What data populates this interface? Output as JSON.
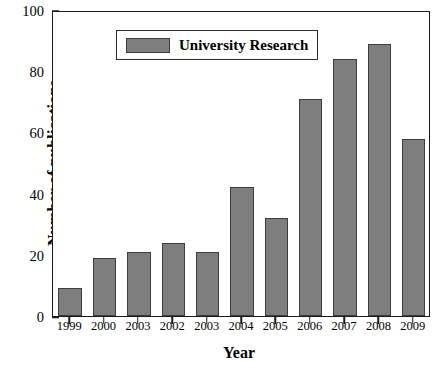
{
  "chart_data": {
    "type": "bar",
    "title": "",
    "xlabel": "Year",
    "ylabel": "Number of publications",
    "categories": [
      "1999",
      "2000",
      "2003",
      "2002",
      "2003",
      "2004",
      "2005",
      "2006",
      "2007",
      "2008",
      "2009"
    ],
    "values": [
      9,
      19,
      21,
      24,
      21,
      42,
      32,
      71,
      84,
      89,
      58
    ],
    "series": [
      {
        "name": "University Research",
        "values": [
          9,
          19,
          21,
          24,
          21,
          42,
          32,
          71,
          84,
          89,
          58
        ],
        "color": "#7e7e7e"
      }
    ],
    "ylim": [
      0,
      100
    ],
    "ytick_labels": [
      "0",
      "20",
      "40",
      "60",
      "80",
      "100"
    ],
    "ytick_values": [
      0,
      20,
      40,
      60,
      80,
      100
    ],
    "yminor_values": [
      10,
      30,
      50,
      70,
      90
    ],
    "grid": false,
    "legend": {
      "position": "top-left",
      "entries": [
        "University Research"
      ]
    }
  },
  "legend": {
    "label": "University Research"
  },
  "axes": {
    "x_title": "Year",
    "y_title": "Number of publications"
  },
  "colors": {
    "bar_fill": "#7e7e7e",
    "bar_edge": "#3d3d3d",
    "axis": "#1a1a1a",
    "background": "#ffffff"
  }
}
